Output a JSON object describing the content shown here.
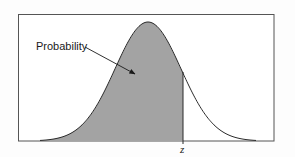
{
  "chart_data": {
    "type": "area",
    "title": "",
    "distribution": "normal",
    "shaded_region": "left tail up to z",
    "annotations": [
      {
        "text": "Probability",
        "arrow_to": "shaded area"
      }
    ],
    "x_marker": {
      "label": "z"
    },
    "xlabel": "",
    "ylabel": "",
    "grid": false,
    "legend": null,
    "colors": {
      "fill": "#a3a3a3",
      "curve": "#2a2a2a",
      "frame": "#555555",
      "arrow": "#1a1a1a"
    }
  },
  "labels": {
    "annotation": "Probability",
    "z_marker": "z"
  }
}
